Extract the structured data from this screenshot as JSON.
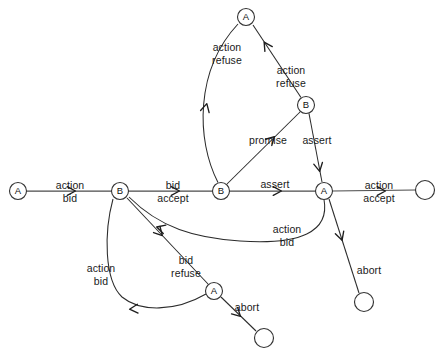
{
  "diagram": {
    "type": "state-transition-diagram",
    "width": 443,
    "height": 360,
    "background_color": "#ffffff",
    "line_color": "#2b2b2b",
    "node_fill": "#ffffff",
    "node_stroke": "#333333",
    "text_color": "#1a1a1a",
    "nodes": [
      {
        "id": "n1",
        "label": "A",
        "x": 18,
        "y": 191,
        "r": 8.5,
        "kind": "state",
        "role": "start-state"
      },
      {
        "id": "n2",
        "label": "B",
        "x": 120,
        "y": 191,
        "r": 8.5,
        "kind": "state",
        "role": "spine-state"
      },
      {
        "id": "n3",
        "label": "B",
        "x": 221,
        "y": 191,
        "r": 8.5,
        "kind": "state",
        "role": "spine-state"
      },
      {
        "id": "n4",
        "label": "A",
        "x": 324,
        "y": 191,
        "r": 8.5,
        "kind": "state",
        "role": "spine-state"
      },
      {
        "id": "n5",
        "label": "",
        "x": 425,
        "y": 190,
        "r": 9.5,
        "kind": "terminal",
        "role": "accept-terminal"
      },
      {
        "id": "n6",
        "label": "A",
        "x": 246,
        "y": 17,
        "r": 8.5,
        "kind": "state",
        "role": "upper-state"
      },
      {
        "id": "n7",
        "label": "B",
        "x": 306,
        "y": 105,
        "r": 8.5,
        "kind": "state",
        "role": "upper-state"
      },
      {
        "id": "n8",
        "label": "A",
        "x": 214,
        "y": 291,
        "r": 8.5,
        "kind": "state",
        "role": "lower-state"
      },
      {
        "id": "n9",
        "label": "",
        "x": 264,
        "y": 338,
        "r": 9.5,
        "kind": "terminal",
        "role": "abort-terminal"
      },
      {
        "id": "n10",
        "label": "",
        "x": 364,
        "y": 302,
        "r": 9.5,
        "kind": "terminal",
        "role": "abort-terminal"
      }
    ],
    "edges": [
      {
        "id": "e1",
        "from": "n1",
        "to": "n2",
        "label_top": "action",
        "label_bottom": "bid",
        "label_x": 70,
        "label_y": 191,
        "path": "M 26.5 191 L 111.5 191",
        "spine": true,
        "arrow": {
          "x": 72,
          "y": 191,
          "angle": 0
        }
      },
      {
        "id": "e2",
        "from": "n2",
        "to": "n3",
        "label_top": "bid",
        "label_bottom": "accept",
        "label_x": 173,
        "label_y": 191,
        "path": "M 128.5 191 L 212.5 191",
        "spine": true,
        "arrow": {
          "x": 176,
          "y": 191,
          "angle": 0
        }
      },
      {
        "id": "e3",
        "from": "n3",
        "to": "n4",
        "label_top": "assert",
        "label_bottom": "",
        "label_x": 275,
        "label_y": 184,
        "path": "M 229.5 191 L 315.5 191",
        "spine": true,
        "arrow": {
          "x": 278,
          "y": 191,
          "angle": 0
        }
      },
      {
        "id": "e4",
        "from": "n4",
        "to": "n5",
        "label_top": "action",
        "label_bottom": "accept",
        "label_x": 379,
        "label_y": 191,
        "path": "M 332.5 191 L 415.5 190",
        "spine": true,
        "arrow": {
          "x": 382,
          "y": 191,
          "angle": 0
        }
      },
      {
        "id": "e5",
        "from": "n3",
        "to": "n6",
        "label_top": "action",
        "label_bottom": "refuse",
        "label_x": 227,
        "label_y": 53,
        "path": "M 218 182.5 C 196 140 195 70 238 24",
        "spine": false,
        "arrow": {
          "x": 206,
          "y": 107,
          "angle": -76
        }
      },
      {
        "id": "e6",
        "from": "n3",
        "to": "n7",
        "label_top": "promise",
        "label_bottom": "",
        "label_x": 268,
        "label_y": 140,
        "path": "M 227 184 L 300 112",
        "spine": false,
        "arrow": {
          "x": 272,
          "y": 139,
          "angle": -45
        }
      },
      {
        "id": "e7",
        "from": "n7",
        "to": "n6",
        "label_top": "action",
        "label_bottom": "refuse",
        "label_x": 291,
        "label_y": 76,
        "path": "M 301 97.5 L 253 25",
        "spine": false,
        "arrow": {
          "x": 266,
          "y": 45,
          "angle": -123
        }
      },
      {
        "id": "e8",
        "from": "n7",
        "to": "n4",
        "label_top": "assert",
        "label_bottom": "",
        "label_x": 317,
        "label_y": 140,
        "path": "M 309 113.5 L 322 182",
        "spine": false,
        "arrow": {
          "x": 319,
          "y": 168,
          "angle": 79
        }
      },
      {
        "id": "e9",
        "from": "n4",
        "to": "n2",
        "label_top": "action",
        "label_bottom": "bid",
        "label_x": 287,
        "label_y": 235,
        "path": "M 324 199.5 C 330 232 300 245 240 241 C 195 238 160 228 129 197",
        "spine": false,
        "arrow": {
          "x": 160,
          "y": 228,
          "angle": -163
        }
      },
      {
        "id": "e10",
        "from": "n2",
        "to": "n8",
        "label_top": "bid",
        "label_bottom": "refuse",
        "label_x": 186,
        "label_y": 266,
        "path": "M 127 198 L 208 284",
        "spine": false,
        "arrow": {
          "x": 160,
          "y": 233,
          "angle": 47
        }
      },
      {
        "id": "e11",
        "from": "n8",
        "to": "n2",
        "label_top": "action",
        "label_bottom": "bid",
        "label_x": 101,
        "label_y": 274,
        "path": "M 206 294 C 175 312 140 312 122 297 C 104 280 104 232 113 199",
        "spine": false,
        "arrow": {
          "x": 133,
          "y": 309,
          "angle": 176
        }
      },
      {
        "id": "e12",
        "from": "n8",
        "to": "n9",
        "label_top": "abort",
        "label_bottom": "",
        "label_x": 247,
        "label_y": 307,
        "path": "M 221 297 L 256 331",
        "spine": false,
        "arrow": {
          "x": 238,
          "y": 314,
          "angle": 44
        }
      },
      {
        "id": "e13",
        "from": "n4",
        "to": "n10",
        "label_top": "abort",
        "label_bottom": "",
        "label_x": 369,
        "label_y": 270,
        "path": "M 329 199 L 359 293",
        "spine": false,
        "arrow": {
          "x": 341,
          "y": 237,
          "angle": 72
        }
      }
    ]
  }
}
